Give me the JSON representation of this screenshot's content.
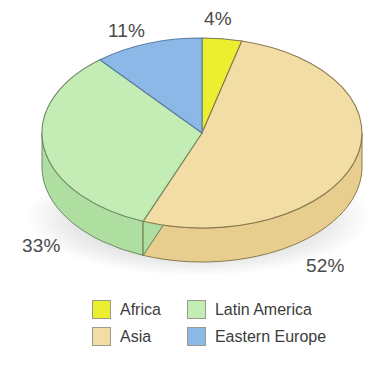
{
  "chart_data": {
    "type": "pie",
    "title": "",
    "subtitle": "",
    "xlabel": "",
    "ylabel": "",
    "style": "3d-exploded-disc",
    "legend_position": "bottom",
    "grid": false,
    "start_angle_deg": 0,
    "direction": "clockwise",
    "categories": [
      "Africa",
      "Asia",
      "Latin America",
      "Eastern Europe"
    ],
    "values": [
      4,
      52,
      33,
      11
    ],
    "unit": "%",
    "data_labels": [
      "4%",
      "52%",
      "33%",
      "11%"
    ],
    "colors": [
      "#ECEE30",
      "#F2DDA4",
      "#C3EDB5",
      "#8CB8E8"
    ],
    "slices": [
      {
        "label": "Africa",
        "value": 4,
        "display": "4%",
        "color": "#ECEE30",
        "side_color": "#D6D82B",
        "edge_color": "#7a7a55"
      },
      {
        "label": "Asia",
        "value": 52,
        "display": "52%",
        "color": "#F2DDA4",
        "side_color": "#E8CE8E",
        "edge_color": "#8a7a50"
      },
      {
        "label": "Latin America",
        "value": 33,
        "display": "33%",
        "color": "#C3EDB5",
        "side_color": "#AEDFA0",
        "edge_color": "#6f8a68"
      },
      {
        "label": "Eastern Europe",
        "value": 11,
        "display": "11%",
        "color": "#8CB8E8",
        "side_color": "#79A6DA",
        "edge_color": "#5a7ea8"
      }
    ]
  },
  "labels": {
    "africa_pct": "4%",
    "asia_pct": "52%",
    "latin_america_pct": "33%",
    "eastern_europe_pct": "11%"
  },
  "legend": {
    "items": [
      {
        "label": "Africa",
        "color": "#ECEE30"
      },
      {
        "label": "Latin America",
        "color": "#C3EDB5"
      },
      {
        "label": "Asia",
        "color": "#F2DDA4"
      },
      {
        "label": "Eastern Europe",
        "color": "#8CB8E8"
      }
    ]
  },
  "colors": {
    "yellow": "#ECEE30",
    "tan": "#F2DDA4",
    "green": "#C3EDB5",
    "blue": "#8CB8E8",
    "text": "#4a4a4a",
    "background": "#ffffff"
  }
}
